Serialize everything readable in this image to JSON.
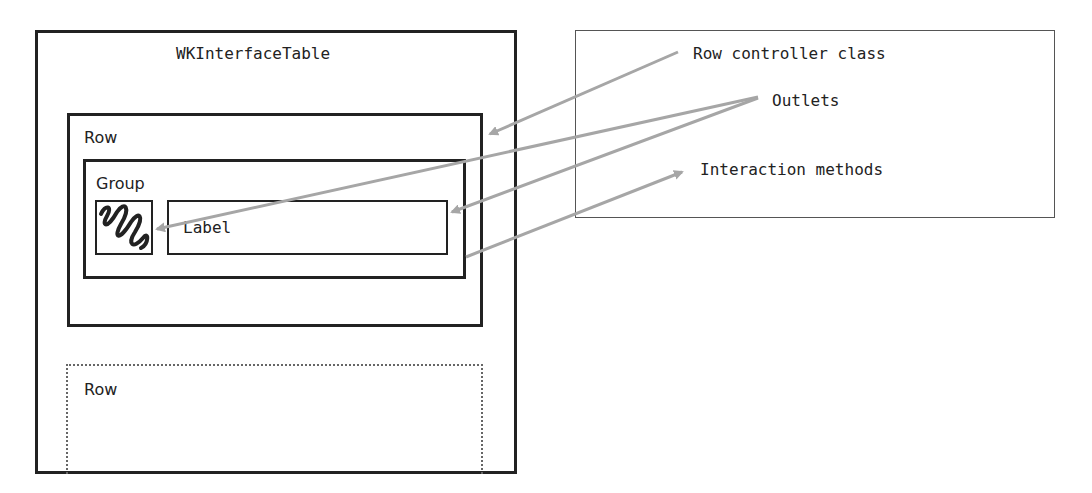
{
  "diagram": {
    "table": {
      "title": "WKInterfaceTable"
    },
    "row": {
      "label": "Row"
    },
    "group": {
      "label": "Group"
    },
    "image": {
      "icon": "squiggle-image-icon"
    },
    "label": {
      "text": "Label"
    },
    "row_placeholder": {
      "label": "Row"
    },
    "controller": {
      "class_label": "Row controller class",
      "outlets_label": "Outlets",
      "methods_label": "Interaction methods"
    },
    "colors": {
      "stroke": "#222222",
      "arrow": "#a6a6a6",
      "dotted": "#666666"
    }
  }
}
